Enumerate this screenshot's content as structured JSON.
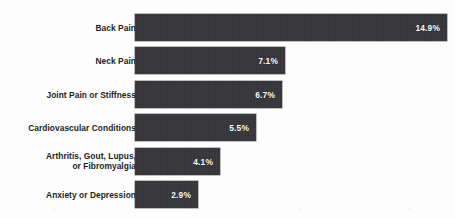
{
  "chart_data": {
    "type": "bar",
    "orientation": "horizontal",
    "title": "",
    "subtitle": "",
    "xlabel": "",
    "ylabel": "",
    "grid": false,
    "legend": null,
    "axis_visible": false,
    "tick_labels": [],
    "xlim": [
      0,
      14.9
    ],
    "value_suffix": "%",
    "categories": [
      "Back Pain",
      "Neck Pain",
      "Joint Pain or Stiffness",
      "Cardiovascular Conditions",
      "Arthritis, Gout, Lupus,\nor Fibromyalgia",
      "Anxiety or Depression"
    ],
    "values": [
      14.9,
      7.1,
      6.7,
      5.5,
      4.1,
      2.9
    ],
    "value_labels": [
      "14.9%",
      "7.1%",
      "6.7%",
      "5.5%",
      "4.1%",
      "2.9%"
    ],
    "bar_color": "#343438",
    "value_label_color": "#ffffff",
    "category_label_color": "#1d1d1f",
    "background_color": "#fdfdfd"
  },
  "bars": [
    {
      "label": "Back Pain",
      "value_label": "14.9%",
      "width_px": 312,
      "top_px": 14
    },
    {
      "label": "Neck Pain",
      "value_label": "7.1%",
      "width_px": 150,
      "top_px": 47
    },
    {
      "label": "Joint Pain or Stiffness",
      "value_label": "6.7%",
      "width_px": 147,
      "top_px": 81
    },
    {
      "label": "Cardiovascular Conditions",
      "value_label": "5.5%",
      "width_px": 121,
      "top_px": 114
    },
    {
      "label": "Arthritis, Gout, Lupus,\nor Fibromyalgia",
      "value_label": "4.1%",
      "width_px": 85,
      "top_px": 148
    },
    {
      "label": "Anxiety or Depression",
      "value_label": "2.9%",
      "width_px": 63,
      "top_px": 181
    }
  ]
}
